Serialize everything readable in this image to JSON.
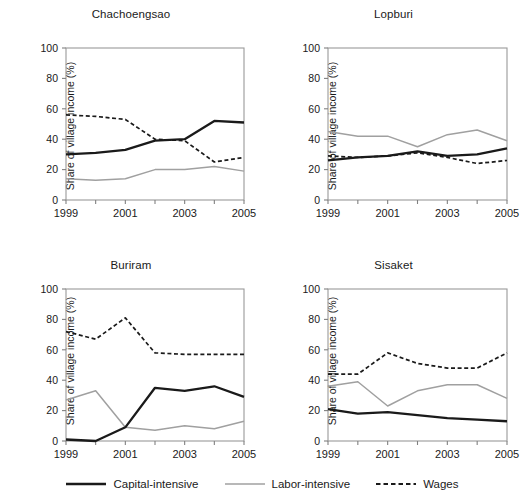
{
  "figure": {
    "ylabel": "Share of village income (%)",
    "yticks": [
      0,
      20,
      40,
      60,
      80,
      100
    ],
    "xticks": [
      1999,
      2001,
      2003,
      2005
    ],
    "xtick_labels": [
      "1999",
      "2001",
      "2003",
      "2005"
    ],
    "colors": {
      "capital_intensive": "#1a1a1a",
      "labor_intensive": "#a0a0a0",
      "wages": "#1a1a1a",
      "axis": "#808080",
      "frame": "#9a9a9a"
    }
  },
  "legend": {
    "position": "bottom-center",
    "items": [
      {
        "label": "Capital-intensive",
        "style": "solid",
        "color": "#1a1a1a",
        "width": 2.2,
        "name": "capital-intensive"
      },
      {
        "label": "Labor-intensive",
        "style": "solid",
        "color": "#a0a0a0",
        "width": 1.4,
        "name": "labor-intensive"
      },
      {
        "label": "Wages",
        "style": "dashed",
        "color": "#1a1a1a",
        "width": 1.6,
        "name": "wages"
      }
    ]
  },
  "chart_data": [
    {
      "type": "line",
      "title": "Chachoengsao",
      "xlabel": "",
      "ylabel": "Share of village income (%)",
      "x": [
        1999,
        2000,
        2001,
        2002,
        2003,
        2004,
        2005
      ],
      "xlim": [
        1999,
        2005
      ],
      "ylim": [
        0,
        100
      ],
      "grid": false,
      "series": [
        {
          "name": "Capital-intensive",
          "values": [
            30,
            31,
            33,
            39,
            40,
            52,
            51
          ]
        },
        {
          "name": "Labor-intensive",
          "values": [
            14,
            13,
            14,
            20,
            20,
            22,
            19
          ]
        },
        {
          "name": "Wages",
          "values": [
            56,
            55,
            53,
            40,
            39,
            25,
            28
          ]
        }
      ]
    },
    {
      "type": "line",
      "title": "Lopburi",
      "xlabel": "",
      "ylabel": "Share of village income (%)",
      "x": [
        1999,
        2000,
        2001,
        2002,
        2003,
        2004,
        2005
      ],
      "xlim": [
        1999,
        2005
      ],
      "ylim": [
        0,
        100
      ],
      "grid": false,
      "series": [
        {
          "name": "Capital-intensive",
          "values": [
            26,
            28,
            29,
            32,
            29,
            30,
            34
          ]
        },
        {
          "name": "Labor-intensive",
          "values": [
            45,
            42,
            42,
            35,
            43,
            46,
            39
          ]
        },
        {
          "name": "Wages",
          "values": [
            29,
            28,
            29,
            31,
            28,
            24,
            26
          ]
        }
      ]
    },
    {
      "type": "line",
      "title": "Buriram",
      "xlabel": "",
      "ylabel": "Share of village income (%)",
      "x": [
        1999,
        2000,
        2001,
        2002,
        2003,
        2004,
        2005
      ],
      "xlim": [
        1999,
        2005
      ],
      "ylim": [
        0,
        100
      ],
      "grid": false,
      "series": [
        {
          "name": "Capital-intensive",
          "values": [
            1,
            0,
            9,
            35,
            33,
            36,
            29
          ]
        },
        {
          "name": "Labor-intensive",
          "values": [
            27,
            33,
            9,
            7,
            10,
            8,
            13
          ]
        },
        {
          "name": "Wages",
          "values": [
            72,
            67,
            81,
            58,
            57,
            57,
            57
          ]
        }
      ]
    },
    {
      "type": "line",
      "title": "Sisaket",
      "xlabel": "",
      "ylabel": "Share of village income (%)",
      "x": [
        1999,
        2000,
        2001,
        2002,
        2003,
        2004,
        2005
      ],
      "xlim": [
        1999,
        2005
      ],
      "ylim": [
        0,
        100
      ],
      "grid": false,
      "series": [
        {
          "name": "Capital-intensive",
          "values": [
            21,
            18,
            19,
            17,
            15,
            14,
            13
          ]
        },
        {
          "name": "Labor-intensive",
          "values": [
            36,
            39,
            23,
            33,
            37,
            37,
            28
          ]
        },
        {
          "name": "Wages",
          "values": [
            44,
            44,
            58,
            51,
            48,
            48,
            58
          ]
        }
      ]
    }
  ]
}
